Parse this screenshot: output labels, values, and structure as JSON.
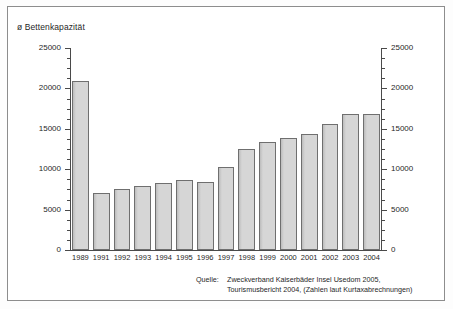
{
  "chart_data": {
    "type": "bar",
    "title": "ø Bettenkapazität",
    "xlabel": "",
    "ylabel": "",
    "ylim": [
      0,
      25000
    ],
    "ytick_labels": [
      "0",
      "5000",
      "10000",
      "15000",
      "20000",
      "25000"
    ],
    "ytick_values": [
      0,
      5000,
      10000,
      15000,
      20000,
      25000
    ],
    "minor_tick_step": 1250,
    "grid": false,
    "legend": "none",
    "dual_axis": true,
    "categories": [
      "1989",
      "1991",
      "1992",
      "1993",
      "1994",
      "1995",
      "1996",
      "1997",
      "1998",
      "1999",
      "2000",
      "2001",
      "2002",
      "2003",
      "2004"
    ],
    "values": [
      20900,
      7100,
      7600,
      7900,
      8300,
      8700,
      8400,
      10300,
      12500,
      13400,
      13900,
      14400,
      15600,
      16800,
      16800
    ],
    "bar_fill": "#d2d2d2",
    "bar_border": "#6f6f6f",
    "axis_color": "#4a4a4a",
    "frame_color": "#8d8d8d",
    "background": "#ffffff"
  },
  "source": {
    "label": "Quelle:",
    "lines": [
      "Zweckverband Kaiserbäder Insel Usedom 2005,",
      "Tourismusbericht 2004, (Zahlen laut Kurtaxabrechnungen)"
    ]
  }
}
